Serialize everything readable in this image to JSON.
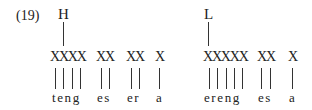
{
  "example_number": "(19)",
  "groups": [
    {
      "tone": "H",
      "units": [
        {
          "skeleton": "XXXX",
          "segments": "teng"
        },
        {
          "skeleton": "XX",
          "segments": "es"
        },
        {
          "skeleton": "XX",
          "segments": "er"
        },
        {
          "skeleton": "X",
          "segments": "a"
        }
      ]
    },
    {
      "tone": "L",
      "units": [
        {
          "skeleton": "XXXXX",
          "segments": "ereng"
        },
        {
          "skeleton": "XX",
          "segments": "es"
        },
        {
          "skeleton": "X",
          "segments": "a"
        }
      ]
    }
  ]
}
